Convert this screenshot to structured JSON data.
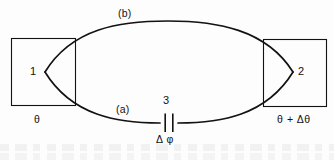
{
  "figure": {
    "background_color": "#fdfdfd",
    "stroke_color": "#121212",
    "nodes": {
      "left_electrode_label": "1",
      "right_electrode_label": "2",
      "junction_label": "3"
    },
    "branches": {
      "upper_label": "(b)",
      "lower_label": "(a)"
    },
    "phases": {
      "left_phase": "θ",
      "right_phase": "θ + Δθ",
      "junction_phase": "Δ φ"
    },
    "icons": {
      "capacitor": "capacitor-symbol",
      "left_box": "electrode-box-left",
      "right_box": "electrode-box-right"
    }
  }
}
